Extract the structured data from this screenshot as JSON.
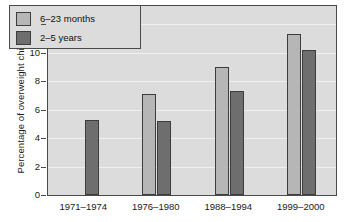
{
  "chart_data": {
    "type": "bar",
    "title": "",
    "xlabel": "",
    "ylabel": "Percentage of overweight children",
    "categories": [
      "1971–1974",
      "1976–1980",
      "1988–1994",
      "1999–2000"
    ],
    "series": [
      {
        "name": "6–23 months",
        "color": "#b6b6b6",
        "values": [
          null,
          7.1,
          9.0,
          11.3
        ]
      },
      {
        "name": "2–5 years",
        "color": "#6e6e6e",
        "values": [
          5.3,
          5.2,
          7.3,
          10.2
        ]
      }
    ],
    "ylim": [
      0,
      13.3
    ],
    "yticks": [
      0,
      2,
      4,
      6,
      8,
      10,
      12
    ],
    "ytick_labels": [
      "0",
      "2",
      "4",
      "6",
      "8",
      "10",
      "12"
    ],
    "grid": true,
    "grid_axis": "y",
    "legend_position": "top-left",
    "plot_background": "#dcdcdc",
    "frame_color": "#4a4a4a"
  },
  "legend": {
    "items": [
      {
        "label": "6–23 months"
      },
      {
        "label": "2–5 years"
      }
    ]
  }
}
